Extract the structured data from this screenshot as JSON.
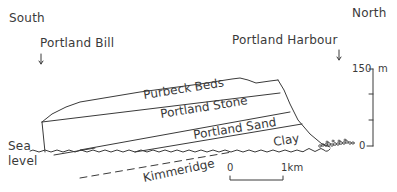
{
  "directions": {
    "left": "South",
    "right": "North"
  },
  "locations": {
    "left": "Portland Bill",
    "right": "Portland Harbour"
  },
  "strata": [
    {
      "name": "Purbeck Beds"
    },
    {
      "name": "Portland Stone"
    },
    {
      "name": "Portland Sand"
    },
    {
      "name": "Clay"
    },
    {
      "name": "Kimmeridge"
    }
  ],
  "sea_level": {
    "line1": "Sea",
    "line2": "level"
  },
  "vertical_scale": {
    "top_value": "150",
    "unit": "m",
    "bottom_value": "0"
  },
  "horizontal_scale": {
    "start": "0",
    "end": "1km"
  },
  "colors": {
    "ink": "#3a3a3a",
    "background": "#ffffff"
  }
}
